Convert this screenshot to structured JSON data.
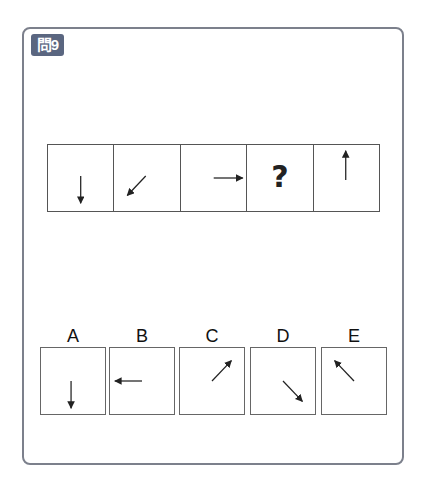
{
  "question": {
    "badge_label": "問9",
    "badge_color": "#5a6680",
    "sequence": [
      {
        "type": "arrow",
        "direction": "down",
        "icon": "arrow-down-icon"
      },
      {
        "type": "arrow",
        "direction": "down-left",
        "icon": "arrow-down-left-icon"
      },
      {
        "type": "arrow",
        "direction": "right",
        "icon": "arrow-right-icon"
      },
      {
        "type": "unknown",
        "text": "?"
      },
      {
        "type": "arrow",
        "direction": "up",
        "icon": "arrow-up-icon"
      }
    ]
  },
  "options": [
    {
      "label": "A",
      "direction": "down",
      "icon": "arrow-down-icon"
    },
    {
      "label": "B",
      "direction": "left",
      "icon": "arrow-left-icon"
    },
    {
      "label": "C",
      "direction": "up-right",
      "icon": "arrow-up-right-icon"
    },
    {
      "label": "D",
      "direction": "down-right",
      "icon": "arrow-down-right-icon"
    },
    {
      "label": "E",
      "direction": "up-left",
      "icon": "arrow-up-left-icon"
    }
  ]
}
